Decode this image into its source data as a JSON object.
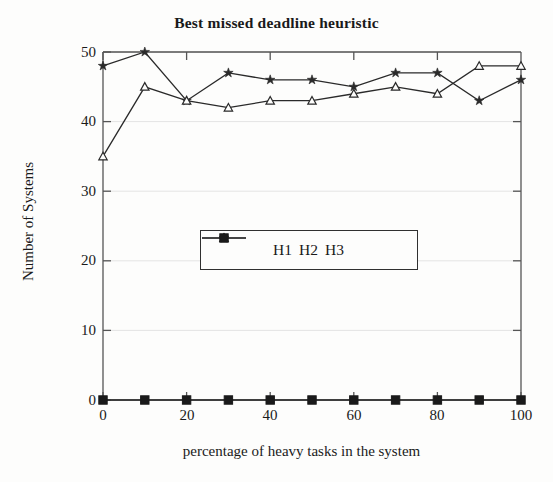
{
  "chart_data": {
    "type": "line",
    "title": "Best missed deadline heuristic",
    "xlabel": "percentage of heavy tasks in the system",
    "ylabel": "Number of Systems",
    "x": [
      0,
      10,
      20,
      30,
      40,
      50,
      60,
      70,
      80,
      90,
      100
    ],
    "xlim": [
      0,
      100
    ],
    "ylim": [
      0,
      50
    ],
    "xticks": [
      0,
      20,
      40,
      60,
      80,
      100
    ],
    "yticks": [
      0,
      10,
      20,
      30,
      40,
      50
    ],
    "grid": "faint horizontal gridlines at y ticks",
    "legend_position": "center",
    "series": [
      {
        "name": "H1",
        "marker": "star",
        "values": [
          48,
          50,
          43,
          47,
          46,
          46,
          45,
          47,
          47,
          43,
          46
        ]
      },
      {
        "name": "H2",
        "marker": "triangle",
        "values": [
          35,
          45,
          43,
          42,
          43,
          43,
          44,
          45,
          44,
          48,
          48
        ]
      },
      {
        "name": "H3",
        "marker": "square",
        "values": [
          0,
          0,
          0,
          0,
          0,
          0,
          0,
          0,
          0,
          0,
          0
        ]
      }
    ]
  },
  "axes": {
    "ytick_labels": [
      "0",
      "10",
      "20",
      "30",
      "40",
      "50"
    ],
    "xtick_labels": [
      "0",
      "20",
      "40",
      "60",
      "80",
      "100"
    ]
  },
  "legend": {
    "items": [
      {
        "label": "H1"
      },
      {
        "label": "H2"
      },
      {
        "label": "H3"
      }
    ]
  },
  "colors": {
    "ink": "#1a1a1a",
    "line": "#303030",
    "grid": "#e2e2e2",
    "background": "#fdfdfc"
  }
}
